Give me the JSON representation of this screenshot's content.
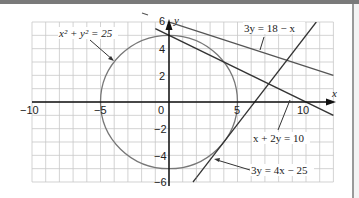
{
  "chart_data": {
    "type": "line",
    "title": "",
    "xlabel": "x",
    "ylabel": "y",
    "xlim": [
      -10,
      12
    ],
    "ylim": [
      -6,
      6
    ],
    "grid": true,
    "x_ticks": [
      "-10",
      "-5",
      "0",
      "5",
      "10"
    ],
    "y_ticks": [
      "6",
      "4",
      "2",
      "0",
      "-2",
      "-4",
      "-6"
    ],
    "series": [
      {
        "name": "x² + y² = 25",
        "kind": "circle",
        "center": [
          0,
          0
        ],
        "radius": 5
      },
      {
        "name": "3y = 18 − x",
        "kind": "line",
        "points": [
          [
            -3,
            7
          ],
          [
            12,
            2
          ]
        ]
      },
      {
        "name": "x + 2y = 10",
        "kind": "line",
        "points": [
          [
            -1,
            5.5
          ],
          [
            12,
            -1
          ]
        ]
      },
      {
        "name": "3y = 4x − 25",
        "kind": "line",
        "points": [
          [
            2,
            -5.67
          ],
          [
            10.75,
            6
          ]
        ]
      }
    ],
    "annotations": [
      {
        "text": "x² + y² = 25",
        "target": "circle"
      },
      {
        "text": "3y = 18 − x",
        "target": "line1"
      },
      {
        "text": "x + 2y = 10",
        "target": "line2"
      },
      {
        "text": "3y = 4x − 25",
        "target": "line3"
      }
    ]
  },
  "labels": {
    "x_axis": "x",
    "y_axis": "y",
    "tick_x_m10": "−10",
    "tick_x_m5": "−5",
    "tick_x_0": "0",
    "tick_x_5": "5",
    "tick_x_10": "10",
    "tick_y_6": "6",
    "tick_y_4": "4",
    "tick_y_2": "2",
    "tick_y_m2": "−2",
    "tick_y_m4": "−4",
    "tick_y_m6": "−6",
    "eq_circle": "x² + y² = 25",
    "eq_line1": "3y = 18 − x",
    "eq_line2": "x + 2y = 10",
    "eq_line3": "3y = 4x − 25"
  }
}
